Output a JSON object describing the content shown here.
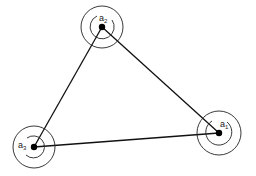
{
  "diagram": {
    "type": "graph",
    "nodes": [
      {
        "id": "a1",
        "label": "a",
        "subscript": "1",
        "x": 219,
        "y": 133
      },
      {
        "id": "a2",
        "label": "a",
        "subscript": "2",
        "x": 102,
        "y": 27
      },
      {
        "id": "a3",
        "label": "a",
        "subscript": "3",
        "x": 34,
        "y": 147
      }
    ],
    "edges": [
      {
        "from": "a2",
        "to": "a3"
      },
      {
        "from": "a2",
        "to": "a1"
      },
      {
        "from": "a3",
        "to": "a1"
      }
    ],
    "colors": {
      "line": "#111111",
      "background": "#ffffff"
    }
  }
}
